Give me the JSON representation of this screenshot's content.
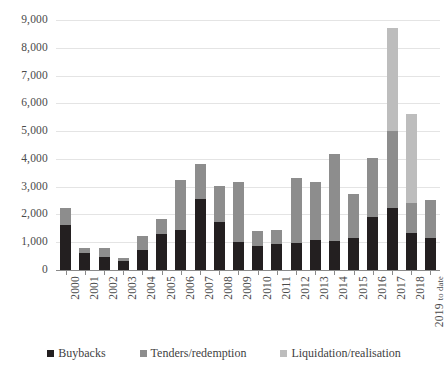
{
  "chart_data": {
    "type": "bar",
    "subtype": "stacked-vertical",
    "title": "",
    "xlabel": "",
    "ylabel": "",
    "ylim": [
      0,
      9000
    ],
    "ytick_step": 1000,
    "grid": true,
    "legend_position": "bottom",
    "ytick_labels": [
      "9,000",
      "8,000",
      "7,000",
      "6,000",
      "5,000",
      "4,000",
      "3,000",
      "2,000",
      "1,000",
      "0"
    ],
    "ytick_values": [
      9000,
      8000,
      7000,
      6000,
      5000,
      4000,
      3000,
      2000,
      1000,
      0
    ],
    "categories": [
      "2000",
      "2001",
      "2002",
      "2003",
      "2004",
      "2005",
      "2006",
      "2007",
      "2008",
      "2009",
      "2010",
      "2011",
      "2012",
      "2013",
      "2014",
      "2015",
      "2016",
      "2017",
      "2018",
      "2019 to date"
    ],
    "series": [
      {
        "name": "Buybacks",
        "color": "#231f20",
        "values": [
          1620,
          620,
          460,
          330,
          720,
          1300,
          1430,
          2550,
          1730,
          1020,
          870,
          950,
          980,
          1080,
          1030,
          1150,
          1920,
          2230,
          1330,
          1150
        ]
      },
      {
        "name": "Tenders/redemption",
        "color": "#8d8d8d",
        "values": [
          610,
          180,
          320,
          120,
          500,
          530,
          1800,
          1270,
          1280,
          2140,
          520,
          480,
          2340,
          2080,
          3140,
          1570,
          2100,
          2770,
          1100,
          1370
        ]
      },
      {
        "name": "Liquidation/realisation",
        "color": "#bdbdbd",
        "values": [
          0,
          0,
          0,
          0,
          0,
          0,
          0,
          0,
          0,
          0,
          0,
          0,
          0,
          0,
          0,
          0,
          0,
          3700,
          3190,
          0
        ]
      }
    ],
    "totals": [
      2230,
      800,
      780,
      450,
      1220,
      1830,
      3230,
      3820,
      3010,
      3160,
      1390,
      1430,
      3320,
      3160,
      4170,
      2720,
      4020,
      8700,
      5620,
      2520
    ]
  },
  "legend": {
    "items": [
      {
        "label": "Buybacks",
        "color": "#231f20"
      },
      {
        "label": "Tenders/redemption",
        "color": "#8d8d8d"
      },
      {
        "label": "Liquidation/realisation",
        "color": "#bdbdbd"
      }
    ]
  }
}
